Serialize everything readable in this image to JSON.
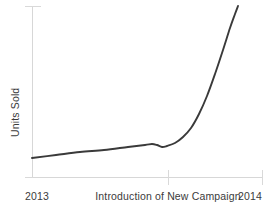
{
  "chart_data": {
    "type": "line",
    "title": "",
    "subtitle": "",
    "xlabel": "",
    "ylabel": "Units Sold",
    "grid": false,
    "legend": null,
    "legend_position": "none",
    "x_tick_labels": [
      "2013",
      "Introduction of New Campaign",
      "2014"
    ],
    "y_tick_labels": [],
    "xlim": [
      0,
      1
    ],
    "ylim": [
      0,
      1
    ],
    "annotations": [
      {
        "text": "Introduction of New Campaign",
        "x": 0.59,
        "note": "x-axis tick marking the campaign launch point"
      }
    ],
    "series": [
      {
        "name": "Units Sold",
        "color": "#3a3a3a",
        "x": [
          0.0,
          0.09,
          0.17,
          0.26,
          0.35,
          0.43,
          0.49,
          0.52,
          0.55,
          0.57,
          0.59,
          0.63,
          0.67,
          0.71,
          0.75,
          0.8,
          0.84,
          0.87,
          0.89,
          0.9
        ],
        "y": [
          0.11,
          0.14,
          0.16,
          0.18,
          0.2,
          0.22,
          0.24,
          0.23,
          0.22,
          0.22,
          0.23,
          0.26,
          0.32,
          0.41,
          0.53,
          0.68,
          0.82,
          0.92,
          0.97,
          1.0
        ]
      }
    ],
    "curve_pixels": {
      "note": "traced path in screenshot pixel coordinates",
      "points": [
        [
          32,
          158
        ],
        [
          56,
          155
        ],
        [
          80,
          152
        ],
        [
          104,
          150
        ],
        [
          128,
          147
        ],
        [
          145,
          145
        ],
        [
          152,
          144
        ],
        [
          157,
          145
        ],
        [
          162,
          147
        ],
        [
          167,
          146
        ],
        [
          175,
          143
        ],
        [
          183,
          137
        ],
        [
          191,
          128
        ],
        [
          199,
          114
        ],
        [
          207,
          96
        ],
        [
          215,
          74
        ],
        [
          223,
          50
        ],
        [
          230,
          28
        ],
        [
          235,
          14
        ],
        [
          238,
          6
        ]
      ]
    }
  },
  "axes": {
    "y_axis_color": "#d7d7d7",
    "x_axis_color": "#d7d7d7",
    "tick_color": "#d9d9d9",
    "axis_label_color": "#3b3b3b"
  },
  "background": "#ffffff"
}
